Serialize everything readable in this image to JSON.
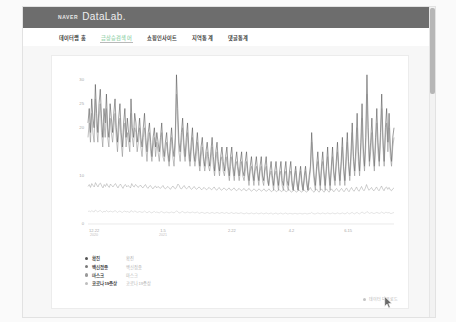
{
  "header": {
    "brand_naver": "NAVER",
    "brand_datalab": "DataLab."
  },
  "nav": {
    "items": [
      {
        "label": "데이터랩 홈",
        "active": false
      },
      {
        "label": "급상승검색어",
        "active": true
      },
      {
        "label": "쇼핑인사이트",
        "active": false
      },
      {
        "label": "지역통계",
        "active": false
      },
      {
        "label": "댓글통계",
        "active": false
      }
    ]
  },
  "card_footer": {
    "icon": "download-icon",
    "label": "데이터 다운로드"
  },
  "legend": {
    "items": [
      {
        "name": "확진",
        "sub": "확진",
        "color": "#555555"
      },
      {
        "name": "백신접종",
        "sub": "백신접종",
        "color": "#7a7a7a"
      },
      {
        "name": "마스크",
        "sub": "마스크",
        "color": "#9a9a9a"
      },
      {
        "name": "코로나19증상",
        "sub": "코로나19증상",
        "color": "#bdbdbd"
      }
    ]
  },
  "chart_data": {
    "type": "line",
    "title": "",
    "xlabel": "",
    "ylabel": "",
    "grid": false,
    "legend_position": "bottom-left",
    "ylim": [
      0,
      32
    ],
    "yticks": [
      0,
      10,
      20,
      25,
      30
    ],
    "ytick_labels": [
      "0",
      "10",
      "20",
      "25",
      "30"
    ],
    "xtick_labels": [
      {
        "main": "12.22",
        "year": "2020"
      },
      {
        "main": "1.5",
        "year": "2021"
      },
      {
        "main": "2.22",
        "year": ""
      },
      {
        "main": "4.2",
        "year": ""
      },
      {
        "main": "6.15",
        "year": ""
      }
    ],
    "xtick_positions": [
      0.02,
      0.245,
      0.47,
      0.665,
      0.85
    ],
    "series": [
      {
        "name": "확진",
        "color": "#4a4a4a",
        "values": [
          21,
          24,
          19,
          26,
          22,
          20,
          29,
          23,
          19,
          25,
          28,
          22,
          18,
          24,
          21,
          27,
          20,
          18,
          25,
          22,
          19,
          23,
          26,
          20,
          17,
          22,
          25,
          19,
          16,
          21,
          24,
          18,
          22,
          19,
          17,
          26,
          20,
          18,
          23,
          21,
          17,
          19,
          22,
          18,
          16,
          20,
          23,
          18,
          15,
          19,
          21,
          17,
          14,
          18,
          20,
          16,
          19,
          17,
          15,
          18,
          21,
          16,
          14,
          17,
          19,
          15,
          13,
          17,
          20,
          16,
          14,
          18,
          31,
          24,
          17,
          15,
          19,
          22,
          17,
          14,
          18,
          21,
          16,
          13,
          17,
          20,
          15,
          13,
          16,
          19,
          15,
          12,
          16,
          18,
          14,
          12,
          15,
          17,
          14,
          12,
          15,
          18,
          14,
          11,
          15,
          17,
          13,
          11,
          14,
          16,
          13,
          11,
          14,
          16,
          12,
          10,
          14,
          16,
          12,
          10,
          13,
          15,
          12,
          10,
          13,
          15,
          11,
          10,
          13,
          15,
          11,
          9,
          12,
          14,
          11,
          9,
          12,
          14,
          11,
          9,
          12,
          14,
          10,
          9,
          12,
          14,
          10,
          8,
          11,
          13,
          10,
          8,
          11,
          13,
          10,
          8,
          11,
          13,
          9,
          8,
          11,
          13,
          9,
          8,
          11,
          13,
          9,
          7,
          10,
          12,
          9,
          7,
          10,
          12,
          9,
          7,
          10,
          12,
          9,
          7,
          10,
          12,
          19,
          14,
          10,
          8,
          12,
          15,
          11,
          8,
          12,
          15,
          11,
          8,
          12,
          16,
          11,
          8,
          12,
          16,
          11,
          9,
          13,
          17,
          12,
          9,
          13,
          18,
          12,
          9,
          14,
          19,
          13,
          10,
          15,
          21,
          14,
          11,
          16,
          23,
          15,
          11,
          17,
          25,
          16,
          12,
          18,
          31,
          20,
          13,
          17,
          22,
          16,
          12,
          18,
          24,
          17,
          13,
          19,
          27,
          18,
          13,
          20,
          24,
          17,
          23,
          16,
          13,
          18,
          20
        ]
      },
      {
        "name": "백신접종",
        "color": "#8a8a8a",
        "values": [
          18,
          21,
          17,
          23,
          19,
          17,
          26,
          20,
          17,
          22,
          25,
          19,
          16,
          21,
          18,
          24,
          18,
          16,
          22,
          19,
          17,
          20,
          23,
          18,
          15,
          19,
          22,
          17,
          14,
          19,
          21,
          16,
          19,
          17,
          15,
          23,
          18,
          16,
          20,
          19,
          15,
          17,
          20,
          16,
          14,
          18,
          20,
          16,
          13,
          17,
          19,
          15,
          13,
          16,
          18,
          14,
          17,
          15,
          13,
          16,
          19,
          14,
          13,
          15,
          17,
          14,
          12,
          15,
          18,
          14,
          12,
          16,
          27,
          21,
          15,
          13,
          17,
          20,
          15,
          13,
          16,
          19,
          14,
          12,
          15,
          18,
          14,
          12,
          14,
          17,
          13,
          11,
          14,
          16,
          13,
          11,
          13,
          15,
          12,
          11,
          13,
          16,
          12,
          10,
          13,
          15,
          12,
          10,
          13,
          14,
          11,
          10,
          12,
          14,
          11,
          9,
          12,
          14,
          11,
          9,
          12,
          13,
          11,
          9,
          11,
          13,
          10,
          9,
          11,
          13,
          10,
          8,
          11,
          12,
          10,
          8,
          11,
          12,
          10,
          8,
          11,
          12,
          9,
          8,
          11,
          12,
          9,
          8,
          10,
          11,
          9,
          7,
          10,
          11,
          9,
          7,
          10,
          11,
          8,
          7,
          10,
          11,
          8,
          7,
          10,
          11,
          8,
          7,
          9,
          11,
          8,
          7,
          9,
          11,
          8,
          7,
          9,
          11,
          8,
          7,
          9,
          11,
          17,
          12,
          9,
          7,
          11,
          13,
          10,
          7,
          11,
          13,
          10,
          7,
          11,
          14,
          10,
          7,
          11,
          14,
          10,
          8,
          12,
          15,
          11,
          8,
          12,
          16,
          11,
          8,
          12,
          17,
          12,
          9,
          13,
          19,
          13,
          10,
          14,
          20,
          13,
          10,
          15,
          22,
          14,
          11,
          16,
          27,
          18,
          12,
          15,
          19,
          14,
          11,
          16,
          21,
          15,
          12,
          17,
          24,
          16,
          12,
          18,
          21,
          15,
          20,
          14,
          12,
          16,
          18
        ]
      },
      {
        "name": "마스크",
        "color": "#9f9f9f",
        "values": [
          7.8,
          8.2,
          7.6,
          8.4,
          8.0,
          7.7,
          8.6,
          8.1,
          7.7,
          8.3,
          8.5,
          7.9,
          7.5,
          8.2,
          7.8,
          8.4,
          7.9,
          7.6,
          8.3,
          8.0,
          7.7,
          8.1,
          8.4,
          7.9,
          7.5,
          8.0,
          8.3,
          7.8,
          7.4,
          8.0,
          8.2,
          7.7,
          8.0,
          7.8,
          7.5,
          8.4,
          7.9,
          7.7,
          8.2,
          8.0,
          7.6,
          7.8,
          8.1,
          7.7,
          7.5,
          7.9,
          8.2,
          7.7,
          7.4,
          7.8,
          8.0,
          7.6,
          7.3,
          7.7,
          7.9,
          7.5,
          7.8,
          7.6,
          7.4,
          7.7,
          8.0,
          7.5,
          7.3,
          7.6,
          7.8,
          7.5,
          7.2,
          7.6,
          7.9,
          7.5,
          7.3,
          7.7,
          8.3,
          8.0,
          7.4,
          7.3,
          7.7,
          8.0,
          7.5,
          7.3,
          7.6,
          7.9,
          7.4,
          7.2,
          7.5,
          7.8,
          7.4,
          7.2,
          7.5,
          7.7,
          7.4,
          7.1,
          7.4,
          7.6,
          7.3,
          7.1,
          7.4,
          7.6,
          7.3,
          7.1,
          7.4,
          7.7,
          7.3,
          7.0,
          7.3,
          7.6,
          7.2,
          7.0,
          7.3,
          7.5,
          7.2,
          7.0,
          7.3,
          7.5,
          7.1,
          7.0,
          7.3,
          7.5,
          7.1,
          6.9,
          7.2,
          7.4,
          7.1,
          6.9,
          7.2,
          7.4,
          7.0,
          6.9,
          7.2,
          7.4,
          7.0,
          6.8,
          7.1,
          7.3,
          7.0,
          6.8,
          7.1,
          7.3,
          7.0,
          6.8,
          7.1,
          7.3,
          6.9,
          6.8,
          7.1,
          7.3,
          6.9,
          6.7,
          7.0,
          7.2,
          6.9,
          6.7,
          7.0,
          7.2,
          6.9,
          6.7,
          7.0,
          7.2,
          6.8,
          6.7,
          7.0,
          7.2,
          6.8,
          6.6,
          6.9,
          7.1,
          6.8,
          6.6,
          6.9,
          7.1,
          6.8,
          6.6,
          6.9,
          7.1,
          6.8,
          6.6,
          6.9,
          7.1,
          7.6,
          7.1,
          6.8,
          6.6,
          7.0,
          7.3,
          6.9,
          6.6,
          7.0,
          7.3,
          6.9,
          6.6,
          7.0,
          7.3,
          6.9,
          6.6,
          7.0,
          7.3,
          6.9,
          6.7,
          7.1,
          7.4,
          7.0,
          6.7,
          7.1,
          7.4,
          7.0,
          6.7,
          7.1,
          7.5,
          7.0,
          6.7,
          7.2,
          7.6,
          7.1,
          6.8,
          7.2,
          7.7,
          7.1,
          6.8,
          7.3,
          7.8,
          7.2,
          6.9,
          7.4,
          8.2,
          7.5,
          7.0,
          7.3,
          7.6,
          7.1,
          6.9,
          7.3,
          7.7,
          7.2,
          6.9,
          7.4,
          7.9,
          7.3,
          6.9,
          7.5,
          7.7,
          7.2,
          7.6,
          7.1,
          6.9,
          7.3,
          7.5
        ]
      },
      {
        "name": "코로나19증상",
        "color": "#c8c8c8",
        "values": [
          2.6,
          2.7,
          2.5,
          2.8,
          2.6,
          2.5,
          2.9,
          2.7,
          2.5,
          2.7,
          2.8,
          2.6,
          2.4,
          2.7,
          2.5,
          2.8,
          2.6,
          2.5,
          2.7,
          2.6,
          2.5,
          2.6,
          2.8,
          2.6,
          2.4,
          2.6,
          2.7,
          2.5,
          2.4,
          2.6,
          2.7,
          2.5,
          2.6,
          2.5,
          2.4,
          2.8,
          2.6,
          2.5,
          2.7,
          2.6,
          2.4,
          2.5,
          2.6,
          2.5,
          2.4,
          2.5,
          2.7,
          2.5,
          2.3,
          2.5,
          2.6,
          2.4,
          2.3,
          2.5,
          2.6,
          2.4,
          2.5,
          2.4,
          2.3,
          2.5,
          2.6,
          2.4,
          2.3,
          2.4,
          2.5,
          2.4,
          2.3,
          2.4,
          2.5,
          2.4,
          2.3,
          2.5,
          2.7,
          2.6,
          2.3,
          2.3,
          2.5,
          2.6,
          2.4,
          2.3,
          2.4,
          2.5,
          2.4,
          2.3,
          2.4,
          2.5,
          2.4,
          2.3,
          2.4,
          2.5,
          2.3,
          2.2,
          2.4,
          2.4,
          2.3,
          2.2,
          2.3,
          2.4,
          2.3,
          2.2,
          2.3,
          2.4,
          2.3,
          2.2,
          2.3,
          2.4,
          2.3,
          2.2,
          2.3,
          2.4,
          2.3,
          2.2,
          2.3,
          2.4,
          2.2,
          2.2,
          2.3,
          2.4,
          2.2,
          2.2,
          2.3,
          2.3,
          2.2,
          2.2,
          2.3,
          2.3,
          2.2,
          2.1,
          2.2,
          2.3,
          2.2,
          2.1,
          2.2,
          2.3,
          2.2,
          2.1,
          2.2,
          2.3,
          2.2,
          2.1,
          2.2,
          2.3,
          2.2,
          2.1,
          2.2,
          2.3,
          2.2,
          2.1,
          2.2,
          2.3,
          2.1,
          2.1,
          2.2,
          2.3,
          2.1,
          2.1,
          2.2,
          2.3,
          2.1,
          2.1,
          2.2,
          2.3,
          2.1,
          2.1,
          2.2,
          2.2,
          2.1,
          2.1,
          2.2,
          2.2,
          2.1,
          2.1,
          2.2,
          2.2,
          2.1,
          2.1,
          2.2,
          2.2,
          2.1,
          2.1,
          2.2,
          2.2,
          2.4,
          2.2,
          2.1,
          2.1,
          2.2,
          2.3,
          2.2,
          2.1,
          2.2,
          2.3,
          2.2,
          2.1,
          2.2,
          2.3,
          2.2,
          2.1,
          2.2,
          2.3,
          2.2,
          2.1,
          2.2,
          2.3,
          2.2,
          2.1,
          2.2,
          2.3,
          2.2,
          2.1,
          2.2,
          2.4,
          2.2,
          2.1,
          2.3,
          2.4,
          2.2,
          2.1,
          2.3,
          2.4,
          2.2,
          2.1,
          2.3,
          2.5,
          2.3,
          2.2,
          2.3,
          2.6,
          2.4,
          2.2,
          2.3,
          2.4,
          2.2,
          2.2,
          2.3,
          2.4,
          2.3,
          2.2,
          2.3,
          2.5,
          2.3,
          2.2,
          2.4,
          2.4,
          2.3,
          2.4,
          2.2,
          2.2,
          2.3,
          2.4
        ]
      }
    ]
  }
}
